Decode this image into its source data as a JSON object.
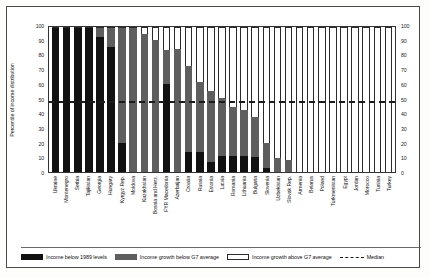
{
  "chart_data": {
    "type": "bar",
    "subtype": "stacked-100-percent",
    "title": "",
    "xlabel": "",
    "ylabel": "Percentile of income distribution",
    "ylim": [
      0,
      100
    ],
    "yticks": [
      0,
      10,
      20,
      30,
      40,
      50,
      60,
      70,
      80,
      90,
      100
    ],
    "ytick_labels": [
      "0",
      "10",
      "20",
      "30",
      "40",
      "50",
      "60",
      "70",
      "80",
      "90",
      "100"
    ],
    "right_axis": true,
    "right_ytick_labels": [
      "0",
      "10",
      "20",
      "30",
      "40",
      "50",
      "60",
      "70",
      "80",
      "90",
      "100"
    ],
    "grid": false,
    "legend_position": "bottom",
    "categories": [
      "Ukraine",
      "Montenegro",
      "Serbia",
      "Tajikistan",
      "Georgia",
      "Hungary",
      "Kyrgyz Rep.",
      "Moldova",
      "Kazakhstan",
      "Bosnia and Herz.",
      "FYR Macedonia",
      "Azerbaijan",
      "Croatia",
      "Russia",
      "Estonia",
      "Latvia",
      "Romania",
      "Lithuania",
      "Bulgaria",
      "Slovenia",
      "Uzbekistan",
      "Slovak Rep.",
      "Armenia",
      "Belarus",
      "Poland",
      "Turkmenistan",
      "Egypt",
      "Jordan",
      "Morocco",
      "Tunisia",
      "Turkey"
    ],
    "series": [
      {
        "name": "Income below 1989 levels",
        "color": "#111111",
        "values": [
          100,
          100,
          100,
          100,
          94,
          87,
          20,
          0,
          0,
          0,
          61,
          0,
          14,
          14,
          7,
          11,
          11,
          11,
          10,
          3,
          0,
          0,
          0,
          0,
          0,
          0,
          0,
          0,
          0,
          0,
          0
        ]
      },
      {
        "name": "Income growth below G7 average",
        "color": "#5e5e5e",
        "values": [
          0,
          0,
          0,
          0,
          6,
          13,
          80,
          100,
          95,
          91,
          23,
          85,
          59,
          48,
          49,
          40,
          34,
          32,
          28,
          17,
          10,
          8,
          0,
          0,
          0,
          0,
          0,
          0,
          0,
          0,
          0
        ]
      },
      {
        "name": "Income growth above G7 average",
        "color": "#ffffff",
        "values": [
          0,
          0,
          0,
          0,
          0,
          0,
          0,
          0,
          5,
          9,
          16,
          15,
          27,
          38,
          44,
          49,
          55,
          57,
          62,
          80,
          90,
          92,
          100,
          100,
          100,
          100,
          100,
          100,
          100,
          100,
          100
        ]
      }
    ],
    "reference_line": {
      "name": "Median",
      "value": 50,
      "style": "dashed",
      "color": "#1b1b1b"
    },
    "legend_entries": [
      "Income below 1989 levels",
      "Income growth below G7 average",
      "Income growth above G7 average",
      "Median"
    ]
  }
}
